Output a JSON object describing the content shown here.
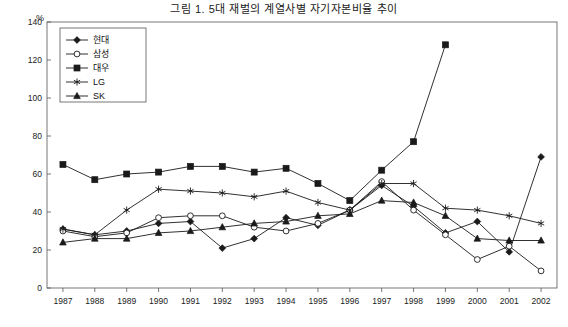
{
  "title": "그림 1. 5대 재벌의 계열사별 자기자본비율 추이",
  "ylabel": "%",
  "chart_data": {
    "type": "line",
    "title": "그림 1. 5대 재벌의 계열사별 자기자본비율 추이",
    "xlabel": "",
    "ylabel": "%",
    "ylim": [
      0,
      140
    ],
    "yticks": [
      0,
      20,
      40,
      60,
      80,
      100,
      120,
      140
    ],
    "grid": false,
    "legend_position": "top-left",
    "categories": [
      "1987",
      "1988",
      "1989",
      "1990",
      "1991",
      "1992",
      "1993",
      "1994",
      "1995",
      "1996",
      "1997",
      "1998",
      "1999",
      "2000",
      "2001",
      "2002"
    ],
    "series": [
      {
        "name": "현대",
        "marker": "diamond-filled",
        "values": [
          31,
          28,
          30,
          34,
          35,
          21,
          26,
          37,
          33,
          41,
          54,
          43,
          29,
          35,
          19,
          69
        ]
      },
      {
        "name": "삼성",
        "marker": "circle-open",
        "values": [
          30,
          27,
          29,
          37,
          38,
          38,
          32,
          30,
          34,
          41,
          56,
          41,
          28,
          15,
          22,
          9
        ]
      },
      {
        "name": "대우",
        "marker": "square-filled",
        "values": [
          65,
          57,
          60,
          61,
          64,
          64,
          61,
          63,
          55,
          46,
          62,
          77,
          128,
          null,
          null,
          null
        ]
      },
      {
        "name": "LG",
        "marker": "star",
        "values": [
          31,
          28,
          41,
          52,
          51,
          50,
          48,
          51,
          45,
          41,
          55,
          55,
          42,
          41,
          38,
          34
        ]
      },
      {
        "name": "SK",
        "marker": "triangle-filled",
        "values": [
          24,
          26,
          26,
          29,
          30,
          32,
          34,
          35,
          38,
          39,
          46,
          45,
          38,
          26,
          25,
          25
        ]
      }
    ]
  },
  "legend": [
    {
      "label": "현대",
      "marker": "diamond-filled"
    },
    {
      "label": "삼성",
      "marker": "circle-open"
    },
    {
      "label": "대우",
      "marker": "square-filled"
    },
    {
      "label": "LG",
      "marker": "star"
    },
    {
      "label": "SK",
      "marker": "triangle-filled"
    }
  ]
}
